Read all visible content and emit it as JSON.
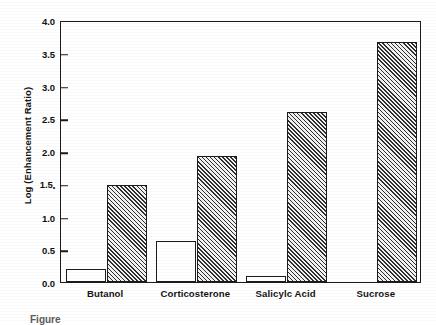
{
  "chart_data": {
    "type": "bar",
    "title": "",
    "xlabel": "",
    "ylabel": "Log (Enhancement Ratio)",
    "categories": [
      "Butanol",
      "Corticosterone",
      "Salicylc Acid",
      "Sucrose"
    ],
    "series": [
      {
        "name": "open",
        "style": "white-open-bar",
        "values": [
          0.2,
          0.62,
          0.09,
          0.0
        ]
      },
      {
        "name": "hatched",
        "style": "diagonal-hatch-bar",
        "values": [
          1.48,
          1.92,
          2.6,
          3.67
        ]
      }
    ],
    "ylim": [
      0.0,
      4.0
    ],
    "ytick_values": [
      0.0,
      0.5,
      1.0,
      1.5,
      2.0,
      2.5,
      3.0,
      3.5,
      4.0
    ],
    "ytick_labels": [
      "0.0",
      "0.5",
      "1.0",
      "1.5",
      "2.0",
      "2.5",
      "3.0",
      "3.5",
      "4.0"
    ],
    "grid": false,
    "legend": "none",
    "legend_position": "none",
    "frame": "box"
  },
  "caption": {
    "text": "Figure"
  },
  "colors": {
    "axis": "#1b1b1b",
    "text": "#141414",
    "hatch_dark": "#2e2e2e",
    "hatch_light": "#f2f2f2",
    "bar_open_fill": "#ffffff",
    "background": "#ffffff"
  }
}
